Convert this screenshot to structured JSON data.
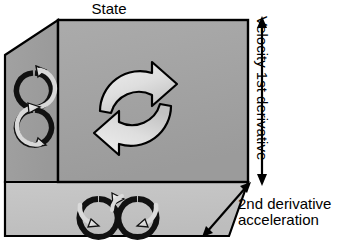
{
  "figure": {
    "title": "State",
    "type": "3d-cube-diagram",
    "axes": {
      "top": {
        "label": "State",
        "position": "top-center",
        "arrow": "none"
      },
      "vertical": {
        "label": "Velocity 1st derivative",
        "position": "right",
        "orientation": "vertical",
        "arrow": "double-headed"
      },
      "diagonal": {
        "label_line1": "2nd derivative",
        "label_line2": "acceleration",
        "position": "bottom-right",
        "orientation": "diagonal",
        "arrow": "double-headed"
      }
    },
    "faces": [
      {
        "name": "front-face",
        "symbol": "two-arc-cycle-arrows",
        "fill": "#a3a3a3",
        "stroke": "#000000"
      },
      {
        "name": "left-face",
        "symbol": "vertical-figure-eight-arrows",
        "fill": "#9d9d9d",
        "stroke": "#000000"
      },
      {
        "name": "bottom-face",
        "symbol": "horizontal-figure-eight-arrows",
        "fill": "#c4c4c4",
        "stroke": "#000000"
      }
    ],
    "colors": {
      "front_face": "#a3a3a3",
      "left_face": "#9d9d9d",
      "bottom_face": "#c4c4c4",
      "outline": "#000000",
      "arrow_fill_light": "#dcdcdc",
      "arrow_fill_dark": "#1a1a1a",
      "text": "#000000",
      "background": "#ffffff"
    }
  }
}
